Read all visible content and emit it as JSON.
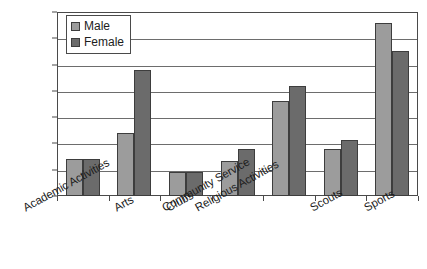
{
  "chart_data": {
    "type": "bar",
    "title": "",
    "subtitle": "",
    "xlabel": "",
    "ylabel": "",
    "ylim": [
      0,
      35
    ],
    "ytick_labels": [
      "0%",
      "5%",
      "10%",
      "15%",
      "20%",
      "25%",
      "30%",
      "35%"
    ],
    "ytick_values": [
      0,
      5,
      10,
      15,
      20,
      25,
      30,
      35
    ],
    "grid": true,
    "legend_position": "top-left",
    "categories": [
      "Academic Activities",
      "Arts",
      "Clubs",
      "Community Service",
      "Religious Activities",
      "Scouts",
      "Sports"
    ],
    "series": [
      {
        "name": "Male",
        "color": "#9c9c9c",
        "values": [
          7,
          12,
          4.5,
          6.7,
          18,
          9,
          33
        ]
      },
      {
        "name": "Female",
        "color": "#6b6b6b",
        "values": [
          7,
          24,
          4.5,
          9,
          21,
          10.7,
          27.5
        ]
      }
    ]
  },
  "legend": {
    "items": [
      {
        "label": "Male"
      },
      {
        "label": "Female"
      }
    ]
  }
}
